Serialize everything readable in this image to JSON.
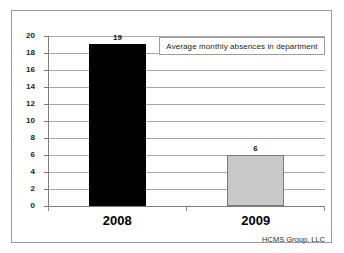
{
  "chart_data": {
    "type": "bar",
    "title": "",
    "annotation": "Average monthly absences in department",
    "categories": [
      "2008",
      "2009"
    ],
    "values": [
      19,
      6
    ],
    "value_labels": [
      "19",
      "6"
    ],
    "xlabel": "",
    "ylabel": "",
    "ylim": [
      0,
      20
    ],
    "ytick_step": 2,
    "yticks": [
      "20",
      "18",
      "16",
      "14",
      "12",
      "10",
      "8",
      "6",
      "4",
      "2",
      "0"
    ],
    "grid": true,
    "legend_position": "top-right-inside",
    "bar_colors": [
      "#000000",
      "#c9c9c9"
    ],
    "bar_border_colors": [
      "#000000",
      "#7a7a7a"
    ],
    "gridline_color": "#a8a8a8",
    "axis_color": "#7d7d7d",
    "frame_color": "#9a9a9a",
    "background_color": "#ffffff"
  },
  "footer": {
    "credit": "HCMS Group, LLC"
  }
}
